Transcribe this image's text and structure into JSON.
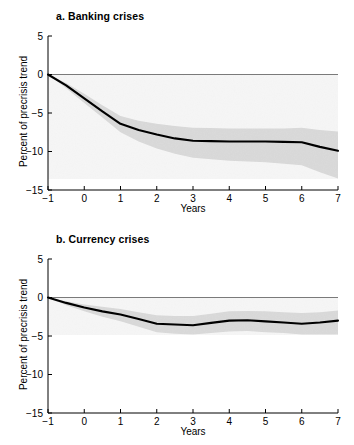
{
  "figure": {
    "background": "#ffffff",
    "line_color": "#000000",
    "band_color": "#e2e2e2",
    "axis_color": "#000000",
    "zeroline_color": "#7a7a7a"
  },
  "chart_data": [
    {
      "type": "line",
      "panel_id": "a",
      "title": "a. Banking crises",
      "xlabel": "Years",
      "ylabel": "Percent of precrisis trend",
      "xlim": [
        -1,
        7
      ],
      "ylim": [
        -15,
        5
      ],
      "xticks": [
        -1,
        0,
        1,
        2,
        3,
        4,
        5,
        6,
        7
      ],
      "xticklabels": [
        "-1",
        "0",
        "1",
        "2",
        "3",
        "4",
        "5",
        "6",
        "7"
      ],
      "yticks": [
        5,
        0,
        -5,
        -10,
        -15
      ],
      "yticklabels": [
        "5",
        "0",
        "-5",
        "-10",
        "-15"
      ],
      "grid": false,
      "legend": null,
      "zero_line": 0,
      "x": [
        -1,
        -0.5,
        0,
        0.5,
        1,
        1.5,
        2,
        2.5,
        3,
        3.5,
        4,
        4.5,
        5,
        5.5,
        6,
        6.5,
        7
      ],
      "series": [
        {
          "name": "Median response",
          "values": [
            0.0,
            -1.4,
            -3.1,
            -4.8,
            -6.4,
            -7.2,
            -7.8,
            -8.3,
            -8.6,
            -8.65,
            -8.7,
            -8.7,
            -8.7,
            -8.75,
            -8.8,
            -9.4,
            -9.9
          ]
        },
        {
          "name": "Confidence band upper",
          "values": [
            0.0,
            -1.1,
            -2.5,
            -4.0,
            -5.4,
            -6.0,
            -6.4,
            -6.7,
            -6.9,
            -6.95,
            -7.0,
            -7.0,
            -7.0,
            -7.0,
            -6.9,
            -7.2,
            -7.4
          ]
        },
        {
          "name": "Confidence band lower",
          "values": [
            0.0,
            -1.8,
            -3.7,
            -5.6,
            -7.5,
            -8.7,
            -9.6,
            -10.3,
            -10.8,
            -11.0,
            -11.2,
            -11.3,
            -11.4,
            -11.6,
            -11.8,
            -12.7,
            -13.5
          ]
        }
      ]
    },
    {
      "type": "line",
      "panel_id": "b",
      "title": "b. Currency crises",
      "xlabel": "Years",
      "ylabel": "Percent of precrisis trend",
      "xlim": [
        -1,
        7
      ],
      "ylim": [
        -15,
        5
      ],
      "xticks": [
        -1,
        0,
        1,
        2,
        3,
        4,
        5,
        6,
        7
      ],
      "xticklabels": [
        "-1",
        "0",
        "1",
        "2",
        "3",
        "4",
        "5",
        "6",
        "7"
      ],
      "yticks": [
        5,
        0,
        -5,
        -10,
        -15
      ],
      "yticklabels": [
        "5",
        "0",
        "-5",
        "-10",
        "-15"
      ],
      "grid": false,
      "legend": null,
      "zero_line": 0,
      "x": [
        -1,
        -0.5,
        0,
        0.5,
        1,
        1.5,
        2,
        2.5,
        3,
        3.5,
        4,
        4.5,
        5,
        5.5,
        6,
        6.5,
        7
      ],
      "series": [
        {
          "name": "Median response",
          "values": [
            0.0,
            -0.7,
            -1.3,
            -1.8,
            -2.2,
            -2.8,
            -3.4,
            -3.5,
            -3.6,
            -3.3,
            -3.0,
            -2.95,
            -3.1,
            -3.25,
            -3.4,
            -3.25,
            -3.0
          ]
        },
        {
          "name": "Confidence band upper",
          "values": [
            0.0,
            -0.5,
            -0.9,
            -1.2,
            -1.5,
            -1.9,
            -2.3,
            -2.4,
            -2.4,
            -2.1,
            -1.8,
            -1.75,
            -1.8,
            -1.9,
            -2.0,
            -1.9,
            -1.7
          ]
        },
        {
          "name": "Confidence band lower",
          "values": [
            0.0,
            -1.0,
            -1.8,
            -2.5,
            -3.1,
            -3.8,
            -4.5,
            -4.7,
            -4.8,
            -4.6,
            -4.4,
            -4.35,
            -4.5,
            -4.6,
            -4.8,
            -4.8,
            -4.8
          ]
        }
      ]
    }
  ]
}
